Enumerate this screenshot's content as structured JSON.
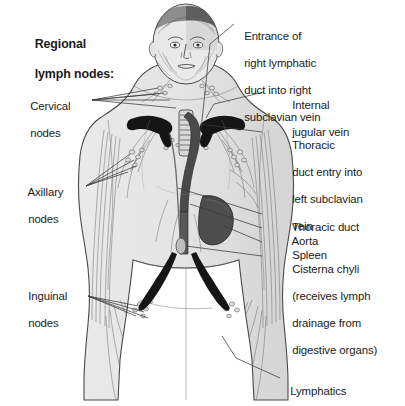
{
  "figure": {
    "kind": "anatomical-illustration",
    "palette": {
      "background": "#ffffff",
      "body_fill": "#e6e6e6",
      "body_fill_shadow": "#d2d2d2",
      "outline": "#4a4a4a",
      "vessel_line": "#6b6b6b",
      "dark_vessel": "#1c1c1c",
      "spleen": "#4f4f4f",
      "hair_dark": "#5a5a5a",
      "leader_line": "#3a3a3a",
      "text": "#1a1a1a"
    }
  },
  "title": {
    "line1": "Regional",
    "line2": "lymph nodes:"
  },
  "left_labels": [
    {
      "id": "cervical",
      "line1": "Cervical",
      "line2": "nodes"
    },
    {
      "id": "axillary",
      "line1": "Axillary",
      "line2": "nodes"
    },
    {
      "id": "inguinal",
      "line1": "Inguinal",
      "line2": "nodes"
    }
  ],
  "right_labels": [
    {
      "id": "right-lymphatic-duct",
      "lines": [
        "Entrance of",
        "right lymphatic",
        "duct into right",
        "subclavian vein"
      ]
    },
    {
      "id": "internal-jugular-vein",
      "lines": [
        "Internal",
        "jugular vein"
      ]
    },
    {
      "id": "thoracic-duct-entry",
      "lines": [
        "Thoracic",
        "duct entry into",
        "left subclavian",
        "vein"
      ]
    },
    {
      "id": "thoracic-duct",
      "lines": [
        "Thoracic duct"
      ]
    },
    {
      "id": "aorta",
      "lines": [
        "Aorta"
      ]
    },
    {
      "id": "spleen",
      "lines": [
        "Spleen"
      ]
    },
    {
      "id": "cisterna-chyli",
      "lines": [
        "Cisterna chyli",
        "(receives lymph",
        "drainage from",
        "digestive organs)"
      ]
    },
    {
      "id": "lymphatics",
      "lines": [
        "Lymphatics"
      ]
    }
  ]
}
